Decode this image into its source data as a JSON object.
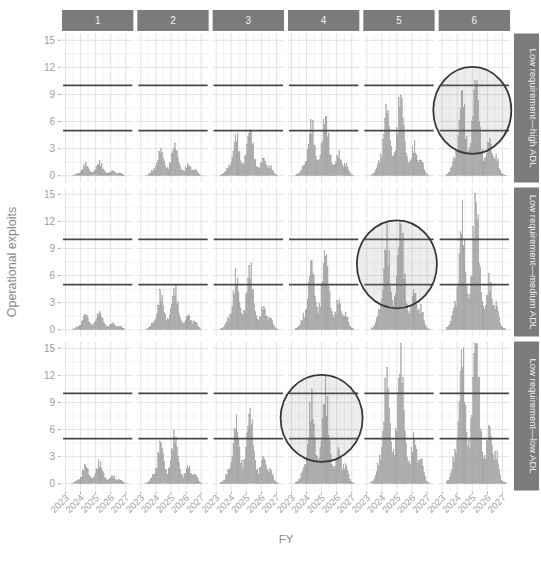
{
  "chart_data": {
    "type": "area",
    "title": "",
    "xlabel": "FY",
    "ylabel": "Operational exploits",
    "x_ticks": [
      2023,
      2024,
      2025,
      2026,
      2027
    ],
    "y_ticks": [
      0,
      3,
      6,
      9,
      12,
      15
    ],
    "xlim": [
      2022.77,
      2027.5
    ],
    "ylim": [
      -0.75,
      15.75
    ],
    "grid": "major and minor, light gray, on",
    "legend": "none",
    "facet_columns": [
      "1",
      "2",
      "3",
      "4",
      "5",
      "6"
    ],
    "facet_rows": [
      "Low requirement—high ADL",
      "Low requirement—medium ADL",
      "Low requirement—low ADL"
    ],
    "reference_lines_y": [
      5,
      10
    ],
    "density_series": {
      "x_start": 2023.3,
      "x_end": 2027.28,
      "bar_step_years": 0.07,
      "components": [
        {
          "center": 2023.8,
          "width": 0.2,
          "height": 0.14
        },
        {
          "center": 2024.32,
          "width": 0.26,
          "height": 0.92
        },
        {
          "center": 2025.25,
          "width": 0.28,
          "height": 1.0
        },
        {
          "center": 2026.15,
          "width": 0.22,
          "height": 0.36
        },
        {
          "center": 2026.62,
          "width": 0.2,
          "height": 0.2
        },
        {
          "center": 2025.1,
          "width": 1.15,
          "height": 0.22
        }
      ],
      "column_scale": [
        1.2,
        2.72,
        4.16,
        5.36,
        7.2,
        8.8
      ],
      "row_scale": [
        1.0,
        1.33,
        1.57
      ],
      "peak_exploits_by_panel": {
        "row_1_high_ADL": [
          1.5,
          3.4,
          5.2,
          6.7,
          9.0,
          11.0
        ],
        "row_2_medium_ADL": [
          2.0,
          4.5,
          6.9,
          9.7,
          12.7,
          14.6
        ],
        "row_3_low_ADL": [
          2.4,
          5.3,
          8.1,
          11.3,
          14.1,
          15.0
        ]
      }
    },
    "annotation_circles": [
      {
        "row": 1,
        "col": 6,
        "x": 2025.0,
        "y": 7.25,
        "rx_px": 39,
        "ry_px": 43.5
      },
      {
        "row": 2,
        "col": 5,
        "x": 2025.0,
        "y": 7.25,
        "rx_px": 40,
        "ry_px": 44
      },
      {
        "row": 3,
        "col": 4,
        "x": 2025.0,
        "y": 7.25,
        "rx_px": 41,
        "ry_px": 43.5
      }
    ],
    "colors": {
      "strip_bg": "#7b7b7b",
      "strip_text": "#f2f2f2",
      "density_fill": "#ababab",
      "density_stroke": "#929292",
      "reference_line": "#474747",
      "grid_major": "#e3e3e3",
      "grid_minor": "#f1f1f1",
      "axis_text": "#9d9d9d",
      "axis_title": "#8c8c8c",
      "tick_mark": "#b3b3b3",
      "circle_stroke": "#383838",
      "circle_fill": "rgba(145,145,145,0.16)"
    }
  }
}
